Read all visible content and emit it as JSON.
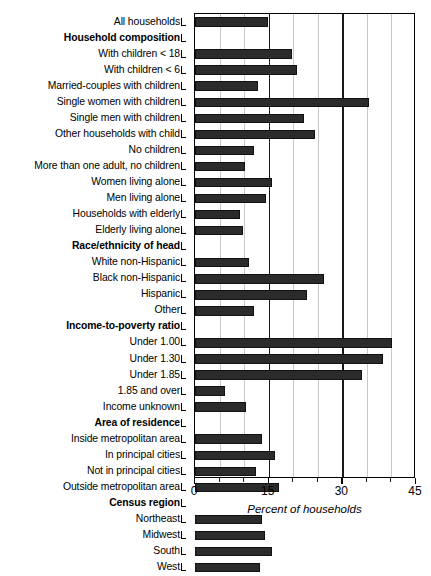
{
  "chart_data": {
    "type": "bar",
    "orientation": "horizontal",
    "title": "",
    "xlabel": "Percent of households",
    "ylabel": "",
    "xlim": [
      0,
      45
    ],
    "xticks": [
      0,
      15,
      30,
      45
    ],
    "xticklabels": [
      "0",
      "15",
      "30",
      "45"
    ],
    "minor_xticks": [
      5,
      10,
      20,
      25,
      35,
      40
    ],
    "grid": "vertical",
    "legend": "none",
    "categories": [
      "All households",
      "Household composition",
      "With children < 18",
      "With children < 6",
      "Married-couples with children",
      "Single women with children",
      "Single men with children",
      "Other households with child",
      "No children",
      "More than one adult, no children",
      "Women living alone",
      "Men living alone",
      "Households with elderly",
      "Elderly living alone",
      "Race/ethnicity of head",
      "White non-Hispanic",
      "Black non-Hispanic",
      "Hispanic",
      "Other",
      "Income-to-poverty ratio",
      "Under 1.00",
      "Under 1.30",
      "Under 1.85",
      "1.85 and over",
      "Income unknown",
      "Area of residence",
      "Inside metropolitan area",
      "In principal cities",
      "Not in principal cities",
      "Outside metropolitan area",
      "Census region",
      "Northeast",
      "Midwest",
      "South",
      "West"
    ],
    "is_header": [
      false,
      true,
      false,
      false,
      false,
      false,
      false,
      false,
      false,
      false,
      false,
      false,
      false,
      false,
      true,
      false,
      false,
      false,
      false,
      true,
      false,
      false,
      false,
      false,
      false,
      true,
      false,
      false,
      false,
      false,
      true,
      false,
      false,
      false,
      false
    ],
    "values": [
      14.8,
      null,
      19.7,
      20.7,
      12.9,
      35.5,
      22.2,
      24.4,
      12.1,
      10.1,
      15.6,
      14.4,
      9.2,
      9.8,
      null,
      10.9,
      26.3,
      22.8,
      12.1,
      null,
      40.1,
      38.2,
      34.1,
      6.2,
      10.3,
      null,
      13.6,
      16.2,
      12.5,
      17.2,
      null,
      13.6,
      14.2,
      15.6,
      13.2
    ],
    "bar_color": "#2b2b2b",
    "grid_color": "#c9c9c9",
    "major_grid_color": "#1a1a1a"
  }
}
